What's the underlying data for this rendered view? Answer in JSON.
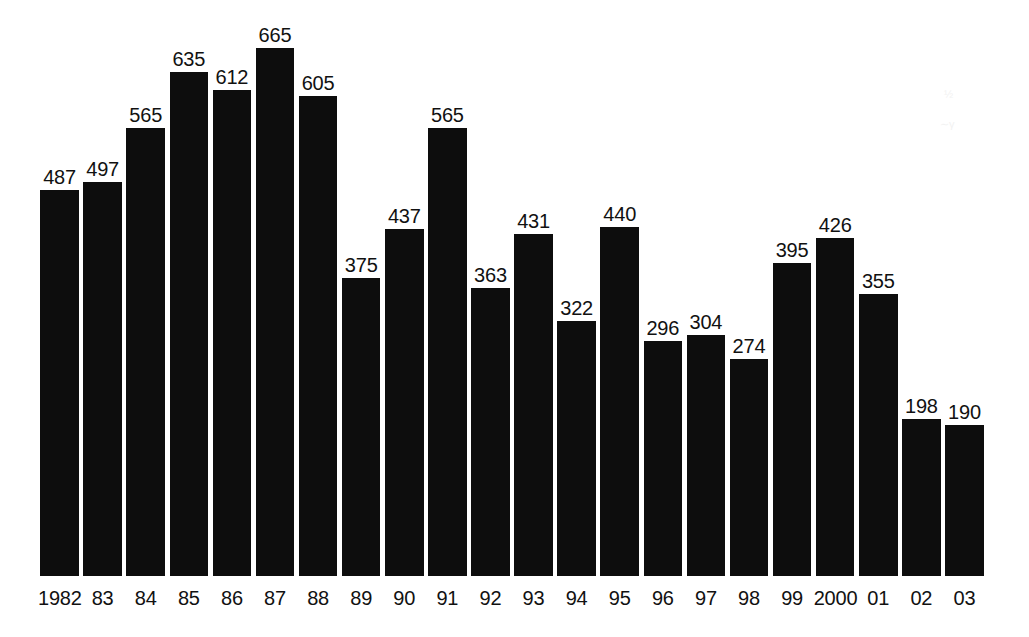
{
  "chart_data": {
    "type": "bar",
    "title": "",
    "subtitle": "",
    "xlabel": "",
    "ylabel": "",
    "categories": [
      "1982",
      "83",
      "84",
      "85",
      "86",
      "87",
      "88",
      "89",
      "90",
      "91",
      "92",
      "93",
      "94",
      "95",
      "96",
      "97",
      "98",
      "99",
      "2000",
      "01",
      "02",
      "03"
    ],
    "values": [
      487,
      497,
      565,
      635,
      612,
      665,
      605,
      375,
      437,
      565,
      363,
      431,
      322,
      440,
      296,
      304,
      274,
      395,
      426,
      355,
      198,
      190
    ],
    "value_labels": [
      "487",
      "497",
      "565",
      "635",
      "612",
      "665",
      "605",
      "375",
      "437",
      "565",
      "363",
      "431",
      "322",
      "440",
      "296",
      "304",
      "274",
      "395",
      "426",
      "355",
      "198",
      "190"
    ],
    "ylim": [
      0,
      665
    ],
    "grid": false,
    "legend": null,
    "legend_position": "none",
    "axis_visible": false,
    "tick_labels_x": [
      "1982",
      "83",
      "84",
      "85",
      "86",
      "87",
      "88",
      "89",
      "90",
      "91",
      "92",
      "93",
      "94",
      "95",
      "96",
      "97",
      "98",
      "99",
      "2000",
      "01",
      "02",
      "03"
    ],
    "tick_labels_y": [],
    "annotations": [],
    "series": [
      {
        "name": "",
        "values": [
          487,
          497,
          565,
          635,
          612,
          665,
          605,
          375,
          437,
          565,
          363,
          431,
          322,
          440,
          296,
          304,
          274,
          395,
          426,
          355,
          198,
          190
        ]
      }
    ]
  },
  "colors": {
    "bar_fill": "#0d0d0d",
    "background": "#ffffff",
    "label_text": "#111111"
  },
  "artifacts": [
    {
      "glyph": "½",
      "x": 944,
      "y": 88
    },
    {
      "glyph": "∼γ",
      "x": 940,
      "y": 118
    }
  ]
}
